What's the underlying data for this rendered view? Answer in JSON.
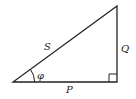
{
  "diagram": {
    "type": "right-triangle",
    "labels": {
      "hypotenuse": "S",
      "vertical_side": "Q",
      "horizontal_side": "P",
      "angle": "φ"
    },
    "right_angle_marker": true,
    "colors": {
      "stroke": "#222222",
      "background": "#ffffff"
    }
  }
}
